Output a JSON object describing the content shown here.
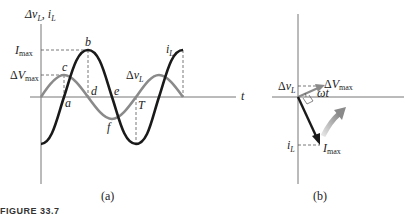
{
  "panel_a": {
    "y_axis_label": "Δv_L, i_L",
    "x_axis_label": "t",
    "level_labels": {
      "i_max": "I_max",
      "dv_max": "ΔV_max"
    },
    "point_labels": {
      "a": "a",
      "b": "b",
      "c": "c",
      "d": "d",
      "e": "e",
      "f": "f",
      "T": "T"
    },
    "curve_labels": {
      "voltage": "Δv_L",
      "current": "i_L"
    },
    "caption": "(a)"
  },
  "panel_b": {
    "voltage_projection_label": "Δv_L",
    "current_projection_label": "i_L",
    "voltage_phasor_label": "ΔV_max",
    "current_phasor_label": "I_max",
    "angle_label": "ωt",
    "caption": "(b)"
  },
  "figure_caption": "FIGURE 33.7",
  "colors": {
    "current": "#1a1a1a",
    "voltage": "#808080",
    "axis": "#707070",
    "rotation_arrow": "#9a9a9a"
  }
}
